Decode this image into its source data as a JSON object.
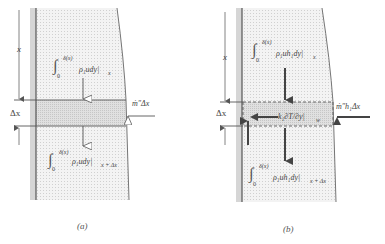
{
  "panel_a": {
    "caption": "(a)",
    "axis_label_x": "x",
    "band_label": "Δx",
    "top_flux": {
      "integral_sign": "∫",
      "upper": "δ(x)",
      "lower": "0",
      "integrand": "ρ₁udy|",
      "subscript": "x"
    },
    "bottom_flux": {
      "integral_sign": "∫",
      "upper": "δ(x)",
      "lower": "0",
      "integrand": "ρ₁udy|",
      "subscript": "x + Δx"
    },
    "side_flux": "ṁ″Δx"
  },
  "panel_b": {
    "caption": "(b)",
    "axis_label_x": "x",
    "band_label": "Δx",
    "top_flux": {
      "integral_sign": "∫",
      "upper": "δ(x)",
      "lower": "0",
      "integrand": "ρ₁uh₁dy|",
      "subscript": "x"
    },
    "bottom_flux": {
      "integral_sign": "∫",
      "upper": "δ(x)",
      "lower": "0",
      "integrand": "ρ₁uh₁dy|",
      "subscript": "x + Δx"
    },
    "side_flux": "ṁ″h₁Δx",
    "wall_flux": "k₁∂T/∂y|",
    "wall_flux_subscript": "w"
  },
  "colors": {
    "film_fill": "#efefef",
    "band_fill": "#dcdcdc",
    "wall_strip": "#d4d4d4",
    "line": "#555555"
  }
}
